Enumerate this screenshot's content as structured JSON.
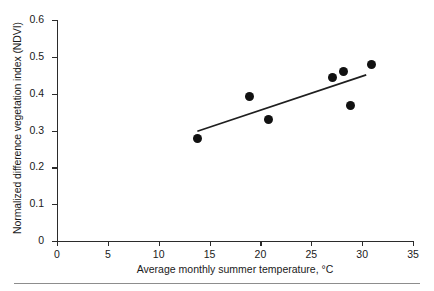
{
  "chart_data": {
    "type": "scatter",
    "title": "",
    "xlabel": "Average monthly summer temperature, °C",
    "ylabel": "Normalized difference vegetation index (NDVI)",
    "xlim": [
      0,
      35
    ],
    "ylim": [
      0,
      0.6
    ],
    "xticks": [
      0,
      5,
      10,
      15,
      20,
      25,
      30,
      35
    ],
    "xtick_labels": [
      "0",
      "5",
      "10",
      "15",
      "20",
      "25",
      "30",
      "35"
    ],
    "yticks": [
      0,
      0.1,
      0.2,
      0.3,
      0.4,
      0.5,
      0.6
    ],
    "ytick_labels": [
      "0",
      "0.1",
      "0.2",
      "0.3",
      "0.4",
      "0.5",
      "0.6"
    ],
    "grid": false,
    "legend": null,
    "marker_color": "#111111",
    "marker_shape": "circle",
    "trendline_color": "#1f1f1f",
    "points": [
      {
        "x": 13.8,
        "y": 0.277
      },
      {
        "x": 18.9,
        "y": 0.391
      },
      {
        "x": 20.8,
        "y": 0.33
      },
      {
        "x": 27.1,
        "y": 0.445
      },
      {
        "x": 28.2,
        "y": 0.461
      },
      {
        "x": 28.9,
        "y": 0.368
      },
      {
        "x": 30.9,
        "y": 0.478
      }
    ],
    "trendline": {
      "x_start": 13.8,
      "y_start": 0.298,
      "x_end": 30.4,
      "y_end": 0.451
    }
  }
}
